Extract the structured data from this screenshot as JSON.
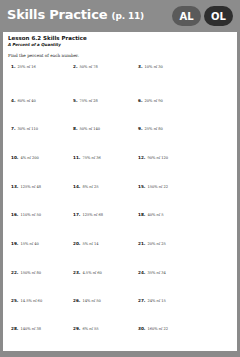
{
  "header": {
    "title": "Skills Practice",
    "page_ref": "(p. 11)",
    "badges": [
      "AL",
      "OL"
    ]
  },
  "worksheet": {
    "lesson_title": "Lesson 6.2 Skills Practice",
    "subtitle": "A Percent of a Quantity",
    "instructions": "Find the percent of each number.",
    "problems": [
      {
        "num": "1.",
        "text": "25% of 16"
      },
      {
        "num": "2.",
        "text": "50% of 78"
      },
      {
        "num": "3.",
        "text": "10% of 30"
      },
      {
        "num": "4.",
        "text": "60% of 40"
      },
      {
        "num": "5.",
        "text": "75% of 28"
      },
      {
        "num": "6.",
        "text": "20% of 90"
      },
      {
        "num": "7.",
        "text": "30% of 110"
      },
      {
        "num": "8.",
        "text": "50% of 140"
      },
      {
        "num": "9.",
        "text": "25% of 80"
      },
      {
        "num": "10.",
        "text": "4% of 200"
      },
      {
        "num": "11.",
        "text": "75% of 36"
      },
      {
        "num": "12.",
        "text": "90% of 120"
      },
      {
        "num": "13.",
        "text": "125% of 48"
      },
      {
        "num": "14.",
        "text": "8% of 25"
      },
      {
        "num": "15.",
        "text": "150% of 22"
      },
      {
        "num": "16.",
        "text": "110% of 50"
      },
      {
        "num": "17.",
        "text": "125% of 68"
      },
      {
        "num": "18.",
        "text": "40% of 5"
      },
      {
        "num": "19.",
        "text": "15% of 40"
      },
      {
        "num": "20.",
        "text": "5% of 14"
      },
      {
        "num": "21.",
        "text": "20% of 25"
      },
      {
        "num": "22.",
        "text": "150% of 80"
      },
      {
        "num": "23.",
        "text": "4.5% of 60"
      },
      {
        "num": "24.",
        "text": "35% of 34"
      },
      {
        "num": "25.",
        "text": "14.5% of 60"
      },
      {
        "num": "26.",
        "text": "14% of 50"
      },
      {
        "num": "27.",
        "text": "24% of 15"
      },
      {
        "num": "28.",
        "text": "140% of 38"
      },
      {
        "num": "29.",
        "text": "6% of 55"
      },
      {
        "num": "30.",
        "text": "160% of 22"
      }
    ]
  }
}
